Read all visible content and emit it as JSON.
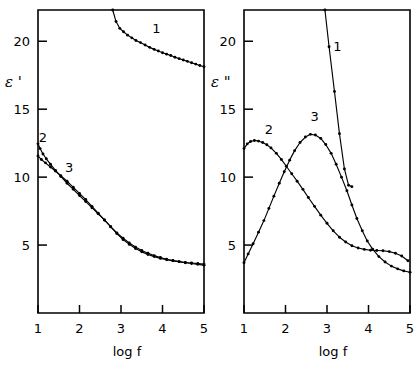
{
  "figure": {
    "background": "#ffffff",
    "ink": "#000000"
  },
  "chart_data": [
    {
      "type": "line",
      "id": "panel-left",
      "title": "",
      "xlabel": "log f",
      "ylabel": "ε '",
      "xlim": [
        1,
        5
      ],
      "ylim": [
        0,
        22.3
      ],
      "xticks": [
        1,
        2,
        3,
        4,
        5
      ],
      "xticklabels": [
        "1",
        "2",
        "3",
        "4",
        "5"
      ],
      "yticks": [
        5,
        10,
        15,
        20
      ],
      "yticklabels": [
        "5",
        "10",
        "15",
        "20"
      ],
      "grid": false,
      "legend": "inline-curve-numbers",
      "annotations": [
        {
          "text": "1",
          "x": 3.85,
          "y": 20.6
        },
        {
          "text": "2",
          "x": 1.12,
          "y": 12.6
        },
        {
          "text": "3",
          "x": 1.75,
          "y": 10.4
        }
      ],
      "series": [
        {
          "name": "1",
          "markers": true,
          "x": [
            2.8,
            2.88,
            2.97,
            3.06,
            3.16,
            3.26,
            3.36,
            3.47,
            3.58,
            3.69,
            3.8,
            3.9,
            4.0,
            4.1,
            4.2,
            4.3,
            4.4,
            4.5,
            4.6,
            4.7,
            4.8,
            4.9,
            5.0
          ],
          "y": [
            22.3,
            21.45,
            20.95,
            20.7,
            20.45,
            20.25,
            20.05,
            19.9,
            19.72,
            19.55,
            19.4,
            19.28,
            19.15,
            19.05,
            18.95,
            18.82,
            18.72,
            18.62,
            18.52,
            18.42,
            18.32,
            18.22,
            18.12
          ]
        },
        {
          "name": "2",
          "markers": true,
          "x": [
            1.0,
            1.05,
            1.12,
            1.2,
            1.3,
            1.42,
            1.55,
            1.7,
            1.85,
            2.0,
            2.15,
            2.3,
            2.45,
            2.6,
            2.75,
            2.9,
            3.05,
            3.2,
            3.35,
            3.5,
            3.65,
            3.8,
            3.95,
            4.1,
            4.25,
            4.4,
            4.55,
            4.7,
            4.85,
            5.0
          ],
          "y": [
            12.45,
            12.1,
            11.7,
            11.35,
            10.95,
            10.5,
            10.05,
            9.55,
            9.1,
            8.65,
            8.2,
            7.75,
            7.3,
            6.85,
            6.35,
            5.85,
            5.4,
            5.05,
            4.75,
            4.5,
            4.3,
            4.15,
            4.02,
            3.92,
            3.84,
            3.78,
            3.72,
            3.68,
            3.64,
            3.6
          ]
        },
        {
          "name": "3",
          "markers": true,
          "x": [
            1.0,
            1.08,
            1.18,
            1.3,
            1.42,
            1.55,
            1.7,
            1.85,
            2.0,
            2.15,
            2.3,
            2.45,
            2.6,
            2.75,
            2.9,
            3.05,
            3.2,
            3.35,
            3.5,
            3.65,
            3.8,
            3.95,
            4.1,
            4.25,
            4.4,
            4.55,
            4.7,
            4.85,
            5.0
          ],
          "y": [
            11.55,
            11.3,
            11.05,
            10.75,
            10.45,
            10.1,
            9.7,
            9.25,
            8.8,
            8.35,
            7.85,
            7.35,
            6.85,
            6.35,
            5.9,
            5.5,
            5.15,
            4.85,
            4.6,
            4.4,
            4.22,
            4.08,
            3.96,
            3.86,
            3.78,
            3.7,
            3.64,
            3.58,
            3.52
          ]
        }
      ]
    },
    {
      "type": "line",
      "id": "panel-right",
      "title": "",
      "xlabel": "log f",
      "ylabel": "ε \"",
      "xlim": [
        1,
        5
      ],
      "ylim": [
        0,
        22.3
      ],
      "xticks": [
        1,
        2,
        3,
        4,
        5
      ],
      "xticklabels": [
        "1",
        "2",
        "3",
        "4",
        "5"
      ],
      "yticks": [
        5,
        10,
        15,
        20
      ],
      "yticklabels": [
        "5",
        "10",
        "15",
        "20"
      ],
      "grid": false,
      "legend": "inline-curve-numbers",
      "annotations": [
        {
          "text": "1",
          "x": 3.25,
          "y": 19.3
        },
        {
          "text": "2",
          "x": 1.6,
          "y": 13.2
        },
        {
          "text": "3",
          "x": 2.7,
          "y": 14.1
        }
      ],
      "series": [
        {
          "name": "1",
          "markers": true,
          "x": [
            2.95,
            3.05,
            3.18,
            3.3,
            3.42,
            3.52,
            3.6
          ],
          "y": [
            22.3,
            19.6,
            16.3,
            13.2,
            10.6,
            9.4,
            9.3
          ]
        },
        {
          "name": "2",
          "markers": true,
          "x": [
            1.0,
            1.08,
            1.16,
            1.25,
            1.35,
            1.45,
            1.55,
            1.65,
            1.78,
            1.9,
            2.02,
            2.15,
            2.28,
            2.42,
            2.55,
            2.7,
            2.85,
            3.0,
            3.15,
            3.3,
            3.45,
            3.6,
            3.75,
            3.9,
            4.05,
            4.2,
            4.35,
            4.5,
            4.65,
            4.8,
            4.95
          ],
          "y": [
            12.1,
            12.45,
            12.62,
            12.7,
            12.65,
            12.55,
            12.38,
            12.15,
            11.75,
            11.3,
            10.8,
            10.25,
            9.7,
            9.1,
            8.5,
            7.85,
            7.2,
            6.6,
            6.05,
            5.58,
            5.22,
            4.95,
            4.78,
            4.68,
            4.62,
            4.6,
            4.58,
            4.52,
            4.4,
            4.2,
            3.85
          ]
        },
        {
          "name": "3",
          "markers": true,
          "x": [
            1.0,
            1.1,
            1.22,
            1.35,
            1.48,
            1.6,
            1.72,
            1.85,
            1.97,
            2.1,
            2.22,
            2.35,
            2.48,
            2.6,
            2.72,
            2.85,
            2.97,
            3.1,
            3.22,
            3.35,
            3.48,
            3.6,
            3.72,
            3.85,
            3.97,
            4.1,
            4.25,
            4.4,
            4.55,
            4.7,
            4.85,
            5.0
          ],
          "y": [
            3.7,
            4.35,
            5.1,
            5.95,
            6.8,
            7.7,
            8.6,
            9.55,
            10.4,
            11.25,
            11.95,
            12.55,
            12.95,
            13.15,
            13.1,
            12.85,
            12.4,
            11.75,
            10.95,
            10.0,
            9.0,
            7.95,
            6.95,
            6.05,
            5.3,
            4.7,
            4.15,
            3.75,
            3.45,
            3.25,
            3.1,
            3.0
          ]
        }
      ]
    }
  ]
}
